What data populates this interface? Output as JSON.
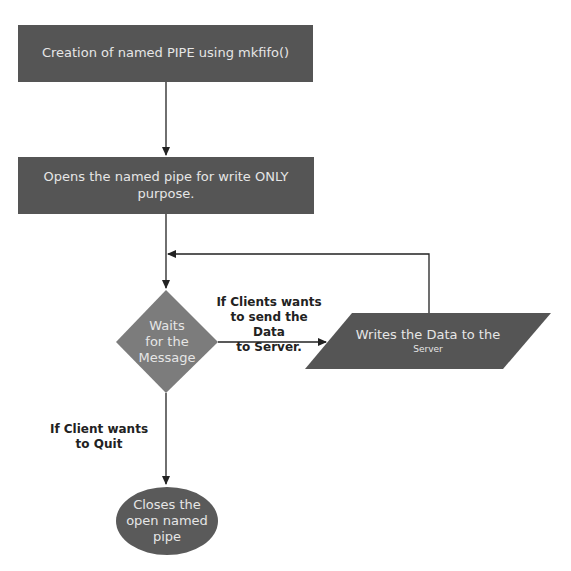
{
  "colors": {
    "process_fill": "#555555",
    "decision_fill": "#7c7c7c",
    "terminal_fill": "#5a5a5a",
    "line": "#222222",
    "node_text": "#e6e6e6"
  },
  "nodes": {
    "create_pipe": {
      "type": "process",
      "text": "Creation of named PIPE using mkfifo()"
    },
    "open_pipe": {
      "type": "process",
      "line1": "Opens the named pipe for write ONLY",
      "line2": "purpose."
    },
    "wait_message": {
      "type": "decision",
      "line1": "Waits",
      "line2": "for the",
      "line3": "Message"
    },
    "write_data": {
      "type": "io",
      "line1": "Writes the Data to the",
      "line2": "Server"
    },
    "close_pipe": {
      "type": "terminal",
      "line1": "Closes the",
      "line2": "open named",
      "line3": "pipe"
    }
  },
  "edges": {
    "send_label": {
      "line1": "If Clients wants",
      "line2": "to send the Data",
      "line3": "to Server."
    },
    "quit_label": {
      "line1": "If Client wants",
      "line2": "to Quit"
    }
  }
}
